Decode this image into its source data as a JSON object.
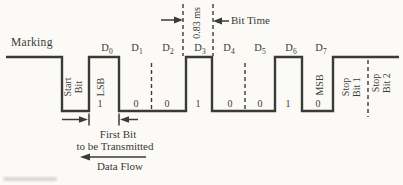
{
  "palette": {
    "ink": "#3a3a38",
    "paper": "#fbfaf6"
  },
  "waveform": {
    "marking_label": "Marking",
    "start_bit_label": {
      "line1": "Start",
      "line2": "Bit"
    },
    "bits": [
      {
        "name": "D",
        "sub": "0",
        "value": "1",
        "tag": "LSB"
      },
      {
        "name": "D",
        "sub": "1",
        "value": "0"
      },
      {
        "name": "D",
        "sub": "2",
        "value": "0"
      },
      {
        "name": "D",
        "sub": "3",
        "value": "1"
      },
      {
        "name": "D",
        "sub": "4",
        "value": "0"
      },
      {
        "name": "D",
        "sub": "5",
        "value": "0"
      },
      {
        "name": "D",
        "sub": "6",
        "value": "1"
      },
      {
        "name": "D",
        "sub": "7",
        "value": "0",
        "tag": "MSB"
      }
    ],
    "stop_bit_1_label": {
      "line1": "Stop",
      "line2": "Bit 1"
    },
    "stop_bit_2_label": {
      "line1": "Stop",
      "line2": "Bit 2"
    }
  },
  "annotations": {
    "bit_time_value": "0.83 ms",
    "bit_time_label": "Bit Time",
    "first_bit_label_line1": "First Bit",
    "first_bit_label_line2": "to be Transmitted",
    "data_flow_label": "Data Flow"
  }
}
